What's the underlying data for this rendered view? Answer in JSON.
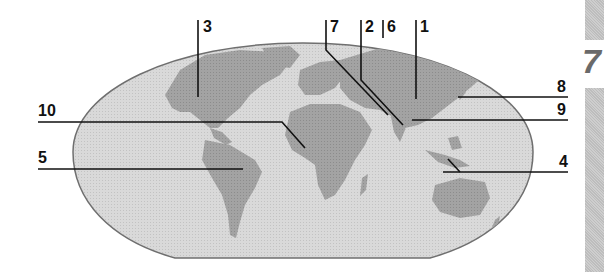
{
  "diagram": {
    "type": "world-map-labeled",
    "projection": "oval world map",
    "colors": {
      "ocean": "#d6d6d6",
      "land": "#9d9d9d",
      "outline": "#6f6f6f",
      "leader_lines": "#111111",
      "side_tab": "#c4c4c4",
      "side_tab_number": "#6a6a6a"
    },
    "labels": [
      {
        "id": "1",
        "text": "1",
        "points_to": "Central Asia / China"
      },
      {
        "id": "2",
        "text": "2",
        "points_to": "Indian subcontinent"
      },
      {
        "id": "3",
        "text": "3",
        "points_to": "North America"
      },
      {
        "id": "4",
        "text": "4",
        "points_to": "Indonesia / Southeast Asian islands"
      },
      {
        "id": "5",
        "text": "5",
        "points_to": "South America"
      },
      {
        "id": "6",
        "text": "6",
        "points_to": "Russia / Northern Asia"
      },
      {
        "id": "7",
        "text": "7",
        "points_to": "Middle East / Arabian region"
      },
      {
        "id": "8",
        "text": "8",
        "points_to": "Japan / Korea"
      },
      {
        "id": "9",
        "text": "9",
        "points_to": "Southeast Asia mainland"
      },
      {
        "id": "10",
        "text": "10",
        "points_to": "West Africa"
      }
    ]
  },
  "side_tab": {
    "number": "7"
  }
}
